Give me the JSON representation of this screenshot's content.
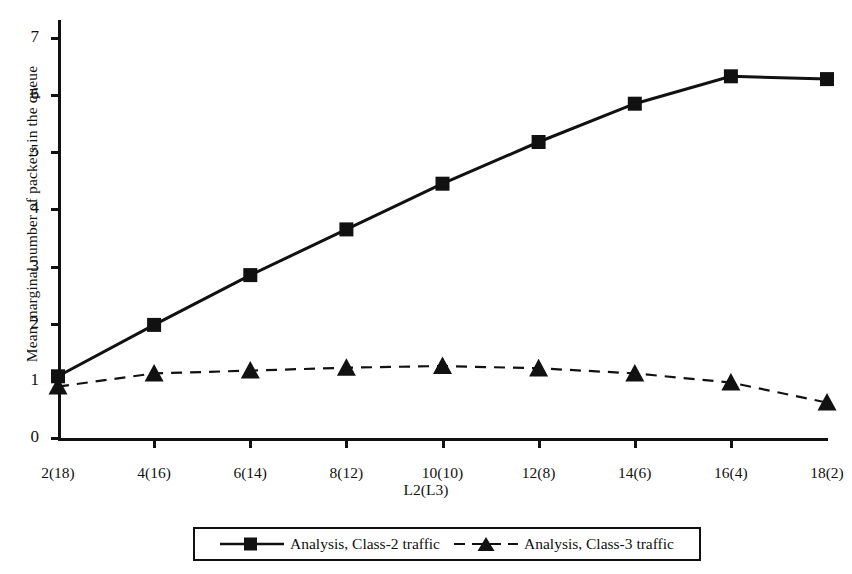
{
  "chart_data": {
    "type": "line",
    "title": "",
    "xlabel": "L2(L3)",
    "ylabel": "Mean marginal number of packets in the queue",
    "categories": [
      "2(18)",
      "4(16)",
      "6(14)",
      "8(12)",
      "10(10)",
      "12(8)",
      "14(6)",
      "16(4)",
      "18(2)"
    ],
    "xtick_labels": [
      "2(18)",
      "4(16)",
      "6(14)",
      "8(12)",
      "10(10)",
      "12(8)",
      "14(6)",
      "16(4)",
      "18(2)"
    ],
    "ytick_labels": [
      "0",
      "1",
      "2",
      "3",
      "4",
      "5",
      "6",
      "7"
    ],
    "ylim": [
      0,
      7
    ],
    "ytick_step": 1,
    "grid": false,
    "legend_position": "bottom",
    "series": [
      {
        "name": "Analysis, Class-2 traffic",
        "marker": "square",
        "linestyle": "solid",
        "color": "#111111",
        "values": [
          1.08,
          1.98,
          2.85,
          3.65,
          4.45,
          5.18,
          5.85,
          6.33,
          6.28
        ]
      },
      {
        "name": "Analysis, Class-3 traffic",
        "marker": "triangle",
        "linestyle": "dashed",
        "color": "#111111",
        "values": [
          0.9,
          1.13,
          1.18,
          1.23,
          1.26,
          1.22,
          1.13,
          0.97,
          0.62
        ]
      }
    ]
  },
  "legend": {
    "entries": [
      {
        "label": "Analysis, Class-2 traffic"
      },
      {
        "label": "Analysis, Class-3 traffic"
      }
    ]
  },
  "axis": {
    "x_title": "L2(L3)",
    "y_title": "Mean marginal number of packets in the queue"
  }
}
